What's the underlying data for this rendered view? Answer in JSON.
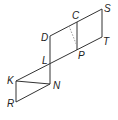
{
  "diagram": {
    "type": "geometry-figure",
    "points": [
      {
        "id": "S",
        "label": "S"
      },
      {
        "id": "T",
        "label": "T"
      },
      {
        "id": "C",
        "label": "C"
      },
      {
        "id": "P",
        "label": "P"
      },
      {
        "id": "D",
        "label": "D"
      },
      {
        "id": "L",
        "label": "L"
      },
      {
        "id": "K",
        "label": "K"
      },
      {
        "id": "N",
        "label": "N"
      },
      {
        "id": "R",
        "label": "R"
      }
    ],
    "segments": [
      {
        "from": "D",
        "to": "S",
        "style": "solid"
      },
      {
        "from": "S",
        "to": "T",
        "style": "solid"
      },
      {
        "from": "K",
        "to": "T",
        "style": "solid"
      },
      {
        "from": "D",
        "to": "N",
        "style": "solid"
      },
      {
        "from": "C",
        "to": "P",
        "style": "solid"
      },
      {
        "from": "K",
        "to": "R",
        "style": "solid"
      },
      {
        "from": "R",
        "to": "N",
        "style": "solid"
      },
      {
        "from": "K",
        "to": "N",
        "style": "solid"
      },
      {
        "from": "C",
        "to": "P",
        "style": "dashed"
      }
    ]
  }
}
